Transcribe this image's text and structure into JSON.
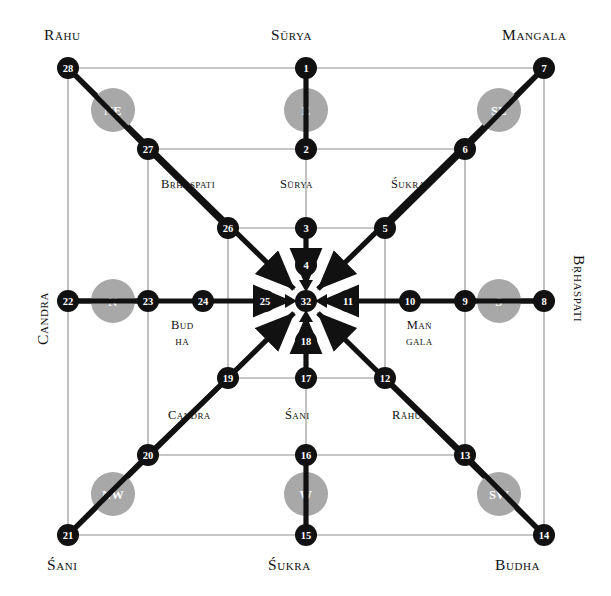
{
  "figure": {
    "colors": {
      "node_fill": "#111111",
      "node_text": "#ffffff",
      "direction_fill": "#a8a8a8",
      "direction_text": "#ffffff",
      "thin_line": "#8d8d8d",
      "thick_line": "#111111",
      "background": "#ffffff"
    }
  },
  "outer_labels": {
    "top_left": "Rāhu",
    "top_center": "Sūrya",
    "top_right": "Mangala",
    "left": "Candra",
    "right": "Bṛhaspati",
    "bottom_left": "Śani",
    "bottom_center": "Śukra",
    "bottom_right": "Budha"
  },
  "inner_labels": {
    "upper_left": "Bṛhaspati",
    "upper_center": "Sūrya",
    "upper_right": "Śukra",
    "mid_left_line1": "Bud",
    "mid_left_line2": "ha",
    "mid_right_line1": "Maṅ",
    "mid_right_line2": "gala",
    "lower_left": "Candra",
    "lower_center": "Śani",
    "lower_right": "Rāhu"
  },
  "direction_circles": [
    {
      "id": "dir-ne",
      "label": "NE",
      "cx": 113,
      "cy": 110,
      "r": 22
    },
    {
      "id": "dir-e",
      "label": "E",
      "cx": 306,
      "cy": 110,
      "r": 22
    },
    {
      "id": "dir-se",
      "label": "SE",
      "cx": 499,
      "cy": 110,
      "r": 22
    },
    {
      "id": "dir-n",
      "label": "N",
      "cx": 113,
      "cy": 301,
      "r": 22
    },
    {
      "id": "dir-s",
      "label": "S",
      "cx": 499,
      "cy": 301,
      "r": 22
    },
    {
      "id": "dir-nw",
      "label": "NW",
      "cx": 113,
      "cy": 494,
      "r": 22
    },
    {
      "id": "dir-w",
      "label": "W",
      "cx": 306,
      "cy": 494,
      "r": 22
    },
    {
      "id": "dir-sw",
      "label": "SW",
      "cx": 499,
      "cy": 494,
      "r": 22
    }
  ],
  "nodes": [
    {
      "n": "1",
      "cx": 306,
      "cy": 68,
      "r": 11
    },
    {
      "n": "2",
      "cx": 306,
      "cy": 149,
      "r": 11
    },
    {
      "n": "3",
      "cx": 306,
      "cy": 228,
      "r": 11
    },
    {
      "n": "4",
      "cx": 306,
      "cy": 265,
      "r": 11
    },
    {
      "n": "5",
      "cx": 385,
      "cy": 228,
      "r": 11
    },
    {
      "n": "6",
      "cx": 465,
      "cy": 149,
      "r": 11
    },
    {
      "n": "7",
      "cx": 544,
      "cy": 68,
      "r": 11
    },
    {
      "n": "8",
      "cx": 544,
      "cy": 301,
      "r": 11
    },
    {
      "n": "9",
      "cx": 465,
      "cy": 301,
      "r": 11
    },
    {
      "n": "10",
      "cx": 410,
      "cy": 301,
      "r": 11
    },
    {
      "n": "11",
      "cx": 348,
      "cy": 301,
      "r": 11
    },
    {
      "n": "12",
      "cx": 385,
      "cy": 378,
      "r": 11
    },
    {
      "n": "13",
      "cx": 465,
      "cy": 455,
      "r": 11
    },
    {
      "n": "14",
      "cx": 544,
      "cy": 535,
      "r": 11
    },
    {
      "n": "15",
      "cx": 306,
      "cy": 535,
      "r": 11
    },
    {
      "n": "16",
      "cx": 306,
      "cy": 455,
      "r": 11
    },
    {
      "n": "17",
      "cx": 306,
      "cy": 378,
      "r": 11
    },
    {
      "n": "18",
      "cx": 306,
      "cy": 341,
      "r": 11
    },
    {
      "n": "19",
      "cx": 228,
      "cy": 378,
      "r": 11
    },
    {
      "n": "20",
      "cx": 148,
      "cy": 455,
      "r": 11
    },
    {
      "n": "21",
      "cx": 68,
      "cy": 535,
      "r": 11
    },
    {
      "n": "22",
      "cx": 68,
      "cy": 301,
      "r": 11
    },
    {
      "n": "23",
      "cx": 148,
      "cy": 301,
      "r": 11
    },
    {
      "n": "24",
      "cx": 203,
      "cy": 301,
      "r": 11
    },
    {
      "n": "25",
      "cx": 265,
      "cy": 301,
      "r": 11
    },
    {
      "n": "26",
      "cx": 228,
      "cy": 228,
      "r": 11
    },
    {
      "n": "27",
      "cx": 148,
      "cy": 149,
      "r": 11
    },
    {
      "n": "28",
      "cx": 68,
      "cy": 68,
      "r": 11
    },
    {
      "n": "32",
      "cx": 306,
      "cy": 301,
      "r": 11
    }
  ]
}
